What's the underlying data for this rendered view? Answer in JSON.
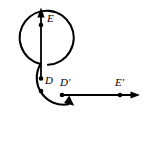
{
  "figure": {
    "background_color": "#ffffff",
    "stroke_color": "#000000",
    "width": 144,
    "height": 148,
    "labels": {
      "field_upper": "E",
      "displacement_upper": "D",
      "displacement_lower": "D'",
      "field_lower": "E'"
    },
    "elements": {
      "circle_arc": {
        "name": "circular-arc",
        "center": [
          41,
          91
        ],
        "radius": 27,
        "start_angle_deg": 285,
        "sweep_deg": 305,
        "arrow_at_end": true
      },
      "center_point": {
        "name": "circle-center-dot",
        "position": [
          41,
          91
        ]
      },
      "vertical_vector": {
        "name": "vertical-arrow",
        "from": [
          41,
          78
        ],
        "to": [
          41,
          10
        ],
        "tick_dot": [
          41,
          25
        ]
      },
      "horizontal_vector": {
        "name": "horizontal-arrow",
        "from": [
          62,
          95
        ],
        "to": [
          139,
          95
        ],
        "tick_dot": [
          120,
          95
        ],
        "origin_dot": [
          62,
          95
        ]
      }
    }
  }
}
